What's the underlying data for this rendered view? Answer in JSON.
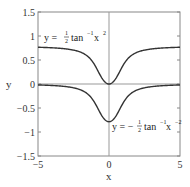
{
  "chart_data": {
    "type": "line",
    "title": "",
    "xlabel": "x",
    "ylabel": "y",
    "xlim": [
      -5,
      5
    ],
    "ylim": [
      -1.5,
      1.5
    ],
    "xticks": [
      -5,
      0,
      5
    ],
    "xtick_labels": [
      "−5",
      "0",
      "5"
    ],
    "yticks": [
      1.5,
      1,
      0.5,
      0,
      -0.5,
      -1,
      -1.5
    ],
    "ytick_labels": [
      "1.5",
      "1",
      "0.5",
      "0",
      "−0.5",
      "−1",
      "−1.5"
    ],
    "grid": false,
    "reference_lines": {
      "x0": true,
      "y0": true
    },
    "series": [
      {
        "name": "y = ½ tan⁻¹ x²",
        "expression": "0.5*atan(x^2)",
        "color": "#333333",
        "x": [
          -5,
          -4,
          -3,
          -2,
          -1.5,
          -1,
          -0.5,
          0,
          0.5,
          1,
          1.5,
          2,
          3,
          4,
          5
        ],
        "values": [
          0.765,
          0.754,
          0.73,
          0.663,
          0.576,
          0.393,
          0.122,
          0,
          0.122,
          0.393,
          0.576,
          0.663,
          0.73,
          0.754,
          0.765
        ]
      },
      {
        "name": "y = −½ tan⁻¹ x⁻²",
        "expression": "-0.5*atan(x^-2)",
        "color": "#333333",
        "x": [
          -5,
          -4,
          -3,
          -2,
          -1.5,
          -1,
          -0.5,
          0,
          0.5,
          1,
          1.5,
          2,
          3,
          4,
          5
        ],
        "values": [
          -0.02,
          -0.031,
          -0.055,
          -0.122,
          -0.209,
          -0.393,
          -0.663,
          -0.785,
          -0.663,
          -0.393,
          -0.209,
          -0.122,
          -0.055,
          -0.031,
          -0.02
        ]
      }
    ],
    "annotations": [
      {
        "text": "y = ½ tan⁻¹ x²",
        "x": -4.4,
        "y": 1.0
      },
      {
        "text": "y = −½ tan⁻¹ x⁻²",
        "x": 0.3,
        "y": -0.9
      }
    ]
  },
  "labels": {
    "xlabel": "x",
    "ylabel": "y",
    "annot1_prefix": "y = ",
    "annot1_num": "1",
    "annot1_den": "2",
    "annot1_fn": "tan",
    "annot1_sup": "−1",
    "annot1_var": " x",
    "annot1_exp": "2",
    "annot2_prefix": "y = −",
    "annot2_num": "1",
    "annot2_den": "2",
    "annot2_fn": "tan",
    "annot2_sup": "−1",
    "annot2_var": " x",
    "annot2_exp": "−2"
  }
}
